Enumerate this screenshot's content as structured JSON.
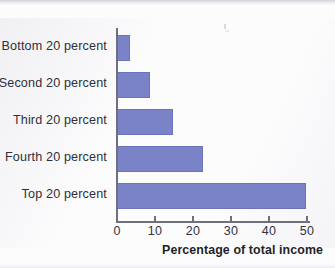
{
  "chart_data": {
    "type": "bar",
    "orientation": "horizontal",
    "title": "",
    "xlabel": "Percentage of total income",
    "ylabel": "",
    "categories": [
      "Bottom 20 percent",
      "Second 20 percent",
      "Third 20 percent",
      "Fourth 20 percent",
      "Top 20 percent"
    ],
    "values": [
      3.4,
      8.7,
      14.7,
      22.6,
      49.8
    ],
    "xlim": [
      0,
      50
    ],
    "xticks": [
      0,
      10,
      20,
      30,
      40,
      50
    ],
    "xtick_labels": [
      "0",
      "10",
      "20",
      "30",
      "40",
      "50"
    ],
    "grid": false,
    "legend": false,
    "bar_color": "#7b83c8",
    "axis_color": "#6f6f80"
  },
  "axes": {
    "x_title": "Percentage of total income"
  }
}
